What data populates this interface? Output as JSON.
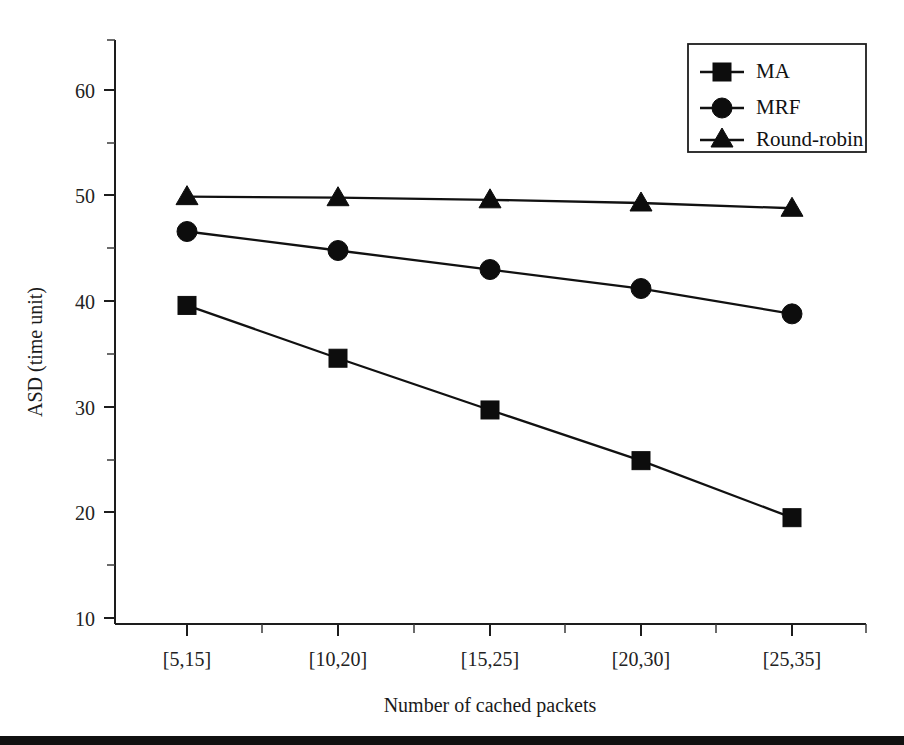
{
  "chart_data": {
    "type": "line",
    "title": "",
    "xlabel": "Number of cached packets",
    "ylabel": "ASD (time unit)",
    "categories": [
      "[5,15]",
      "[10,20]",
      "[15,25]",
      "[20,30]",
      "[25,35]"
    ],
    "series": [
      {
        "name": "MA",
        "marker": "square",
        "values": [
          39.6,
          34.6,
          29.7,
          24.9,
          19.5
        ]
      },
      {
        "name": "MRF",
        "marker": "circle",
        "values": [
          46.6,
          44.8,
          43.0,
          41.2,
          38.8
        ]
      },
      {
        "name": "Round-robin",
        "marker": "triangle",
        "values": [
          49.9,
          49.8,
          49.6,
          49.3,
          48.8
        ]
      }
    ],
    "ylim": [
      10,
      65
    ],
    "yticks": [
      10,
      20,
      30,
      40,
      50,
      60
    ],
    "ytick_labels": [
      "10",
      "20",
      "30",
      "40",
      "50",
      "60"
    ],
    "yminor_ticks": [
      15,
      25,
      35,
      45,
      55,
      65
    ],
    "grid": false,
    "legend_position": "top-right",
    "legend_entries": [
      "MA",
      "MRF",
      "Round-robin"
    ],
    "colors": {
      "series": "#111111",
      "axis": "#1d1d1d",
      "background": "#ffffff"
    }
  }
}
